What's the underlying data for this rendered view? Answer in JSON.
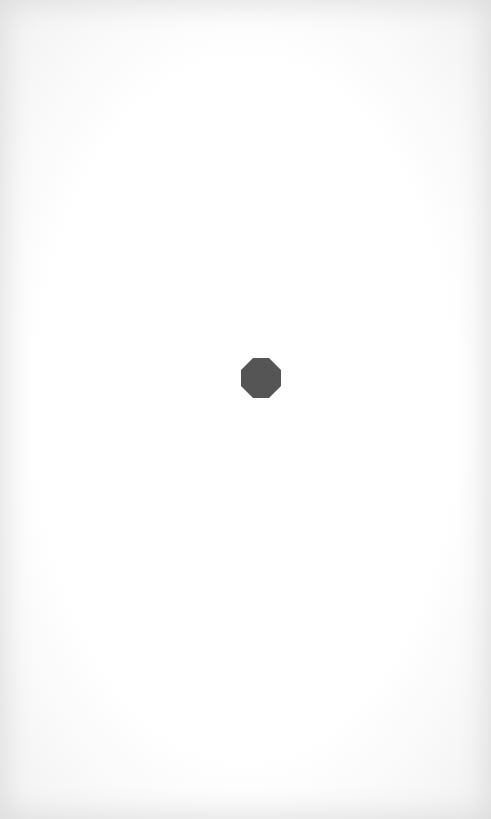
{
  "canvas": {
    "background_color": "#ffffff",
    "edge_shade_color": "#e6e6e6"
  },
  "center_shape": {
    "icon": "octagon-icon",
    "color": "#555555"
  }
}
